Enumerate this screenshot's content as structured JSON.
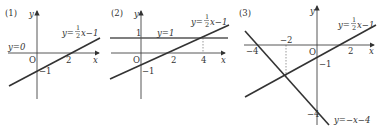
{
  "panels": [
    {
      "label": "(1)",
      "axis_x": "x",
      "axis_y": "y",
      "origin": "O",
      "tick_x": "2",
      "tick_y": "−1",
      "line_label": {
        "prefix": "y=",
        "num": "1",
        "den": "2",
        "suffix": "x−1"
      },
      "extra_label": "y=0"
    },
    {
      "label": "(2)",
      "axis_x": "x",
      "axis_y": "y",
      "origin": "O",
      "tick_x_1": "2",
      "tick_x_2": "4",
      "tick_y_pos": "1",
      "tick_y_neg": "−1",
      "line_label": {
        "prefix": "y=",
        "num": "1",
        "den": "2",
        "suffix": "x−1"
      },
      "extra_label": "y=1"
    },
    {
      "label": "(3)",
      "axis_x": "x",
      "axis_y": "y",
      "origin": "O",
      "tick_x_neg4": "−4",
      "tick_x_neg2": "−2",
      "tick_x_2": "2",
      "tick_y_neg1": "−1",
      "tick_y_neg4": "−4",
      "line_label": {
        "prefix": "y=",
        "num": "1",
        "den": "2",
        "suffix": "x−1"
      },
      "line2_label": "y=−x−4"
    }
  ]
}
